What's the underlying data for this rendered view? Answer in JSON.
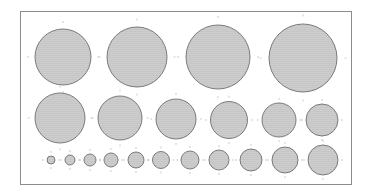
{
  "diagram": {
    "kind": "circle-size-template",
    "colors": {
      "background": "#ffffff",
      "frame": "#8c8c8c",
      "circle_fill": "#c6c6c6",
      "circle_stroke": "#6e6e6e",
      "tick": "#b4b4b4"
    },
    "frame": {
      "x": 20,
      "y": 11,
      "w": 332,
      "h": 174
    },
    "rows": [
      {
        "name": "row-1-large",
        "circles": [
          {
            "cx": 63,
            "cy": 57,
            "r": 28
          },
          {
            "cx": 137,
            "cy": 57,
            "r": 30
          },
          {
            "cx": 218,
            "cy": 57,
            "r": 32
          },
          {
            "cx": 303,
            "cy": 58,
            "r": 34
          }
        ]
      },
      {
        "name": "row-2-medium",
        "circles": [
          {
            "cx": 60,
            "cy": 118,
            "r": 25
          },
          {
            "cx": 120,
            "cy": 118,
            "r": 22
          },
          {
            "cx": 176,
            "cy": 119,
            "r": 20
          },
          {
            "cx": 229,
            "cy": 120,
            "r": 18.5
          },
          {
            "cx": 279,
            "cy": 120,
            "r": 17
          },
          {
            "cx": 322,
            "cy": 120,
            "r": 16
          }
        ]
      },
      {
        "name": "row-3-small",
        "circles": [
          {
            "cx": 51,
            "cy": 160,
            "r": 4
          },
          {
            "cx": 70,
            "cy": 160,
            "r": 5
          },
          {
            "cx": 90,
            "cy": 160,
            "r": 6
          },
          {
            "cx": 111,
            "cy": 160,
            "r": 7
          },
          {
            "cx": 136,
            "cy": 160,
            "r": 8
          },
          {
            "cx": 161,
            "cy": 160,
            "r": 8.5
          },
          {
            "cx": 190,
            "cy": 160,
            "r": 9
          },
          {
            "cx": 219,
            "cy": 160,
            "r": 10
          },
          {
            "cx": 251,
            "cy": 160,
            "r": 11
          },
          {
            "cx": 285,
            "cy": 160,
            "r": 13
          },
          {
            "cx": 323,
            "cy": 160,
            "r": 15
          }
        ]
      }
    ]
  }
}
